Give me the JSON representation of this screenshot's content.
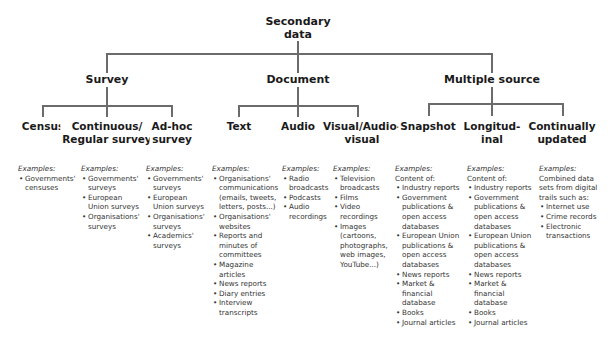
{
  "root": {
    "label_line1": "Secondary",
    "label_line2": "data"
  },
  "categories": [
    {
      "label": "Survey",
      "children": [
        {
          "label_line1": "Census",
          "label_line2": "",
          "examples_title": "Examples:",
          "intro": "",
          "items": [
            "Governments' censuses"
          ]
        },
        {
          "label_line1": "Continuous/",
          "label_line2": "Regular survey",
          "examples_title": "Examples:",
          "intro": "",
          "items": [
            "Governments' surveys",
            "European Union surveys",
            "Organisations' surveys"
          ]
        },
        {
          "label_line1": "Ad-hoc",
          "label_line2": "survey",
          "examples_title": "Examples:",
          "intro": "",
          "items": [
            "Governments' surveys",
            "European Union surveys",
            "Organisations' surveys",
            "Academics' surveys"
          ]
        }
      ]
    },
    {
      "label": "Document",
      "children": [
        {
          "label_line1": "Text",
          "label_line2": "",
          "examples_title": "Examples:",
          "intro": "",
          "items": [
            "Organisations' communications (emails, tweets, letters, posts...)",
            "Organisations' websites",
            "Reports and minutes of committees",
            "Magazine articles",
            "News reports",
            "Diary entries",
            "Interview transcripts"
          ]
        },
        {
          "label_line1": "Audio",
          "label_line2": "",
          "examples_title": "Examples:",
          "intro": "",
          "items": [
            "Radio broadcasts",
            "Podcasts",
            "Audio recordings"
          ]
        },
        {
          "label_line1": "Visual/Audio-",
          "label_line2": "visual",
          "examples_title": "Examples:",
          "intro": "",
          "items": [
            "Television broadcasts",
            "Films",
            "Video recordings",
            "Images (cartoons, photographs, web images, YouTube...)"
          ]
        }
      ]
    },
    {
      "label": "Multiple source",
      "children": [
        {
          "label_line1": "Snapshot",
          "label_line2": "",
          "examples_title": "Examples:",
          "intro": "Content of:",
          "items": [
            "Industry reports",
            "Government publications & open access databases",
            "European Union publications & open access databases",
            "News reports",
            "Market & financial database",
            "Books",
            "Journal articles"
          ]
        },
        {
          "label_line1": "Longitud-",
          "label_line2": "inal",
          "examples_title": "Examples:",
          "intro": "Content of:",
          "items": [
            "Industry reports",
            "Government publications & open access databases",
            "European Union publications & open access databases",
            "News reports",
            "Market & financial database",
            "Books",
            "Journal articles"
          ]
        },
        {
          "label_line1": "Continually",
          "label_line2": "updated",
          "examples_title": "Examples:",
          "intro": "Combined data sets from digital trails such as:",
          "items": [
            "Internet use",
            "Crime records",
            "Electronic transactions"
          ]
        }
      ]
    }
  ],
  "colors": {
    "connector": "#6b6b6b",
    "text": "#1a1a1a"
  }
}
